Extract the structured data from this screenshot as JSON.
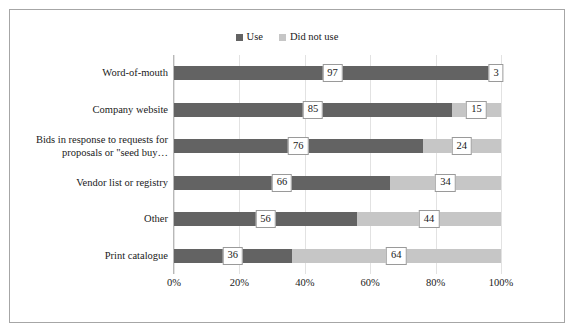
{
  "chart_data": {
    "type": "bar",
    "subtype": "stacked-horizontal-100pct",
    "title": "",
    "xlabel": "",
    "ylabel": "",
    "xlim": [
      0,
      100
    ],
    "xticks": [
      "0%",
      "20%",
      "40%",
      "60%",
      "80%",
      "100%"
    ],
    "xtick_values": [
      0,
      20,
      40,
      60,
      80,
      100
    ],
    "grid": true,
    "grid_axis": "x",
    "legend_position": "top-center",
    "categories": [
      "Word-of-mouth",
      "Company website",
      "Bids in response to requests for proposals or \"seed buy…",
      "Vendor list or registry",
      "Other",
      "Print catalogue"
    ],
    "series": [
      {
        "name": "Use",
        "color": "#636363",
        "values": [
          97,
          85,
          76,
          66,
          56,
          36
        ]
      },
      {
        "name": "Did not use",
        "color": "#c6c6c6",
        "values": [
          3,
          15,
          24,
          34,
          44,
          64
        ]
      }
    ]
  },
  "legend": {
    "entries": [
      {
        "label": "Use",
        "color": "#636363"
      },
      {
        "label": "Did not use",
        "color": "#c6c6c6"
      }
    ]
  },
  "colors": {
    "use": "#636363",
    "did_not_use": "#c6c6c6",
    "frame_border": "#a6a6a6",
    "gridline": "#e2e2e2",
    "axis": "#b8b8b8",
    "label_box_border": "#9a9a9a",
    "background": "#ffffff",
    "text": "#1a1a1a"
  },
  "rows": [
    {
      "category": "Word-of-mouth",
      "category_lines": [
        "Word-of-mouth"
      ],
      "use": 97,
      "did_not_use": 3,
      "use_label": "97",
      "did_not_use_label": "3"
    },
    {
      "category": "Company website",
      "category_lines": [
        "Company website"
      ],
      "use": 85,
      "did_not_use": 15,
      "use_label": "85",
      "did_not_use_label": "15"
    },
    {
      "category": "Bids in response to requests for proposals or \"seed buy…",
      "category_lines": [
        "Bids in response to requests for",
        "proposals or \"seed buy…"
      ],
      "use": 76,
      "did_not_use": 24,
      "use_label": "76",
      "did_not_use_label": "24"
    },
    {
      "category": "Vendor list or registry",
      "category_lines": [
        "Vendor list or registry"
      ],
      "use": 66,
      "did_not_use": 34,
      "use_label": "66",
      "did_not_use_label": "34"
    },
    {
      "category": "Other",
      "category_lines": [
        "Other"
      ],
      "use": 56,
      "did_not_use": 44,
      "use_label": "56",
      "did_not_use_label": "44"
    },
    {
      "category": "Print catalogue",
      "category_lines": [
        "Print catalogue"
      ],
      "use": 36,
      "did_not_use": 64,
      "use_label": "36",
      "did_not_use_label": "64"
    }
  ],
  "axis": {
    "x_tick_labels": [
      "0%",
      "20%",
      "40%",
      "60%",
      "80%",
      "100%"
    ]
  }
}
